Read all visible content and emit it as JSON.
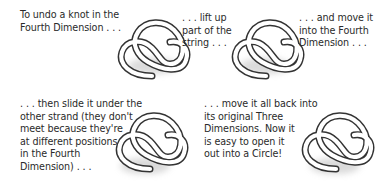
{
  "steps": [
    {
      "id": 1,
      "caption": "To undo a knot in the\nFourth Dimension . . ."
    },
    {
      "id": 2,
      "caption": ". . . lift up\npart of the\nstring . . ."
    },
    {
      "id": 3,
      "caption": ". . . and move it\ninto the Fourth\nDimension . . ."
    },
    {
      "id": 4,
      "caption": ". . . then slide it under the\nother strand (they don't\nmeet because they're\nat different positions\nin the Fourth\nDimension) . . ."
    },
    {
      "id": 5,
      "caption": ". . . move it all back into\nits original Three\nDimensions. Now it\nis easy to open it\nout into a Circle!"
    }
  ],
  "icons": {
    "knot": "trefoil-knot-icon"
  },
  "colors": {
    "background": "#ffffff",
    "text": "#2a2a2a",
    "strand_outline": "#333333",
    "strand_fill": "#ffffff",
    "shadow": "#9a9a9a"
  }
}
